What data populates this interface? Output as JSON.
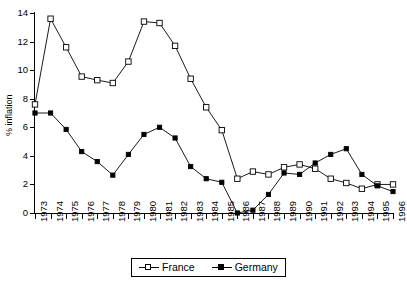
{
  "chart_data": {
    "type": "line",
    "title": "",
    "xlabel": "",
    "ylabel": "% inflation",
    "ylim": [
      0,
      14
    ],
    "yticks": [
      0,
      2,
      4,
      6,
      8,
      10,
      12,
      14
    ],
    "grid": false,
    "legend_position": "bottom-center",
    "categories": [
      "1973",
      "1974",
      "1975",
      "1976",
      "1977",
      "1978",
      "1979",
      "1980",
      "1981",
      "1982",
      "1983",
      "1984",
      "1985",
      "1986",
      "1987",
      "1988",
      "1989",
      "1990",
      "1991",
      "1992",
      "1993",
      "1994",
      "1995",
      "1996"
    ],
    "series": [
      {
        "name": "France",
        "marker": "open-square",
        "values": [
          7.6,
          13.6,
          11.6,
          9.55,
          9.3,
          9.1,
          10.6,
          13.4,
          13.3,
          11.7,
          9.4,
          7.4,
          5.8,
          2.4,
          2.9,
          2.7,
          3.2,
          3.4,
          3.1,
          2.4,
          2.1,
          1.7,
          2.0,
          2.0
        ]
      },
      {
        "name": "Germany",
        "marker": "filled-square",
        "values": [
          7.0,
          7.0,
          5.85,
          4.3,
          3.6,
          2.65,
          4.1,
          5.5,
          6.0,
          5.25,
          3.25,
          2.4,
          2.15,
          0.0,
          0.2,
          1.3,
          2.8,
          2.7,
          3.5,
          4.1,
          4.5,
          2.7,
          1.9,
          1.5
        ]
      }
    ]
  },
  "legend": {
    "items": [
      {
        "label": "France",
        "marker": "open-square"
      },
      {
        "label": "Germany",
        "marker": "filled-square"
      }
    ]
  },
  "axes": {
    "y_title": "% inflation"
  }
}
